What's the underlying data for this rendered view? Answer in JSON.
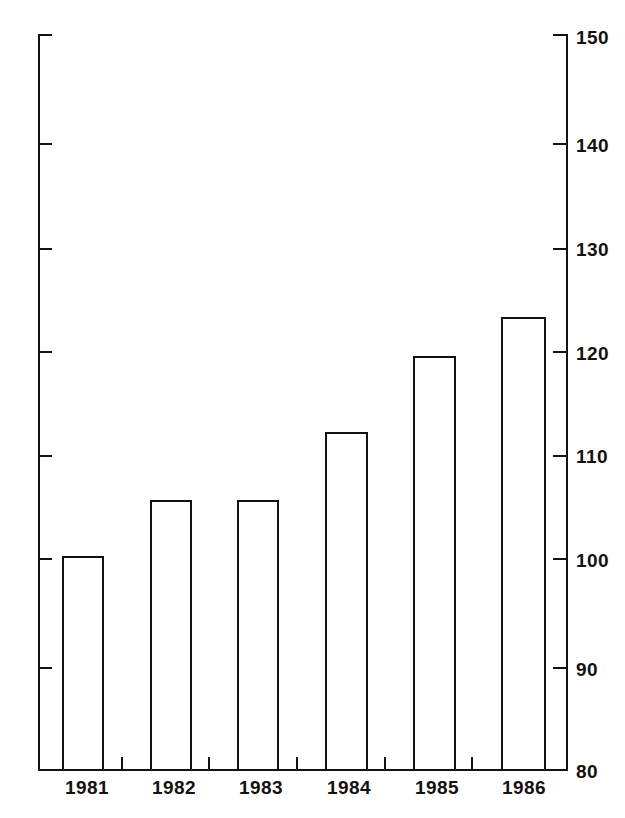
{
  "chart_data": {
    "type": "bar",
    "title": "",
    "subtitle": "",
    "xlabel": "",
    "ylabel": "",
    "categories": [
      "1981",
      "1982",
      "1983",
      "1984",
      "1985",
      "1986"
    ],
    "values": [
      100.4,
      105.7,
      105.7,
      112.2,
      119.4,
      123.1
    ],
    "ylim": [
      80,
      150
    ],
    "ytick_labels": [
      "150",
      "140",
      "130",
      "120",
      "110",
      "100",
      "90",
      "80"
    ],
    "ytick_values": [
      150,
      140,
      130,
      120,
      110,
      100,
      90,
      80
    ],
    "grid": false,
    "legend": null,
    "series": [
      {
        "name": "",
        "values": [
          100.4,
          105.7,
          105.7,
          112.2,
          119.4,
          123.1
        ]
      }
    ],
    "bar_style": {
      "fill": "#ffffff",
      "stroke": "#14110f"
    }
  },
  "axes": {
    "left_ticks": [
      "150",
      "140",
      "130",
      "120",
      "110",
      "100",
      "90",
      "80"
    ],
    "right_ticks": [
      "150",
      "140",
      "130",
      "120",
      "110",
      "100",
      "90",
      "80"
    ]
  },
  "colors": {
    "ink": "#14110f",
    "background": "#ffffff"
  }
}
